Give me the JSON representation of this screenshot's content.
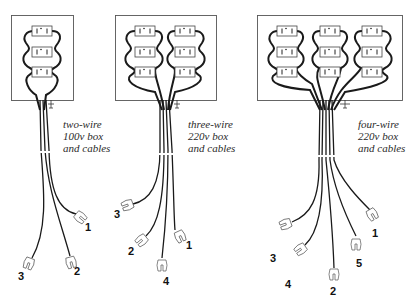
{
  "diagrams": [
    {
      "id": "two-wire",
      "caption": [
        "two-wire",
        "100v box",
        "and cables"
      ],
      "outlets": 3,
      "columns": 1,
      "cable_labels": [
        "1",
        "2",
        "3"
      ]
    },
    {
      "id": "three-wire",
      "caption": [
        "three-wire",
        "220v box",
        "and cables"
      ],
      "outlets": 6,
      "columns": 2,
      "cable_labels": [
        "3",
        "2",
        "4",
        "1"
      ]
    },
    {
      "id": "four-wire",
      "caption": [
        "four-wire",
        "220v box",
        "and cables"
      ],
      "outlets": 9,
      "columns": 3,
      "cable_labels": [
        "3",
        "4",
        "2",
        "5",
        "1"
      ]
    }
  ],
  "colors": {
    "line": "#1a1a1a",
    "box": "#555555",
    "background": "#ffffff"
  }
}
